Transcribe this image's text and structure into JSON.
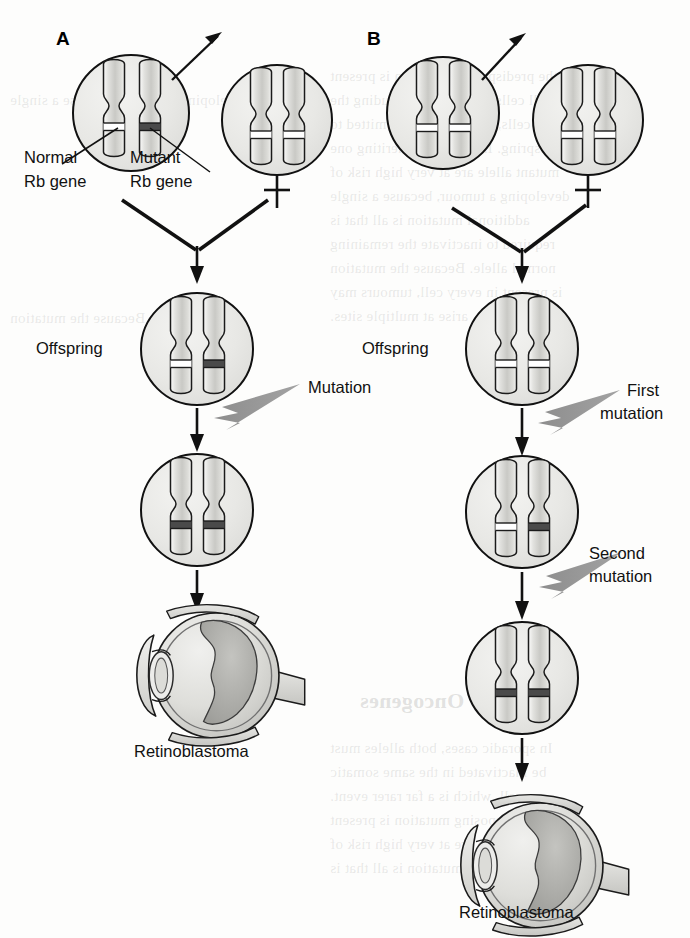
{
  "figure": {
    "background_color": "#fdfdfc",
    "ink_color": "#111111",
    "mutation_arrow_color": "#8c8c8c",
    "cell_fill": "#e9e9e7",
    "chromosome_fill_light": "#d9d9d7",
    "normal_band_color": "#ffffff",
    "mutant_band_color": "#4a4a4a",
    "width": 690,
    "height": 938
  },
  "panels": [
    {
      "letter": "A",
      "type": "hereditary",
      "parents": [
        {
          "name": "carrier-parent",
          "chromosomes": [
            {
              "band": "normal"
            },
            {
              "band": "mutant"
            }
          ],
          "callout_arrow": true
        },
        {
          "name": "normal-parent",
          "chromosomes": [
            {
              "band": "normal"
            },
            {
              "band": "normal"
            }
          ],
          "cross_symbol": "✝"
        }
      ],
      "gene_labels": [
        {
          "line1": "Normal",
          "line2": "Rb gene",
          "points_to": "left-chromosome-band"
        },
        {
          "line1": "Mutant",
          "line2": "Rb gene",
          "points_to": "right-chromosome-band"
        }
      ],
      "offspring_label": "Offspring",
      "offspring_chromosomes": [
        {
          "band": "normal"
        },
        {
          "band": "mutant"
        }
      ],
      "mutation_steps": [
        {
          "label_line1": "Mutation",
          "label_line2": "",
          "result_chromosomes": [
            {
              "band": "mutant"
            },
            {
              "band": "mutant"
            }
          ]
        }
      ],
      "outcome_label": "Retinoblastoma"
    },
    {
      "letter": "B",
      "type": "sporadic",
      "parents": [
        {
          "name": "normal-parent-left",
          "chromosomes": [
            {
              "band": "normal"
            },
            {
              "band": "normal"
            }
          ],
          "callout_arrow": true
        },
        {
          "name": "normal-parent-right",
          "chromosomes": [
            {
              "band": "normal"
            },
            {
              "band": "normal"
            }
          ],
          "cross_symbol": "✝"
        }
      ],
      "gene_labels": [],
      "offspring_label": "Offspring",
      "offspring_chromosomes": [
        {
          "band": "normal"
        },
        {
          "band": "normal"
        }
      ],
      "mutation_steps": [
        {
          "label_line1": "First",
          "label_line2": "mutation",
          "result_chromosomes": [
            {
              "band": "normal"
            },
            {
              "band": "mutant"
            }
          ]
        },
        {
          "label_line1": "Second",
          "label_line2": "mutation",
          "result_chromosomes": [
            {
              "band": "mutant"
            },
            {
              "band": "mutant"
            }
          ]
        }
      ],
      "outcome_label": "Retinoblastoma"
    }
  ],
  "ghost_text": {
    "lines": [
      "the predisposing mutation is present",
      "in all cells of the body, including the",
      "germ cells, and may be transmitted to",
      "offspring. Individuals inheriting one",
      "mutant allele are at very high risk of",
      "developing a tumour, because a single",
      "additional mutation is all that is",
      "required to inactivate the remaining",
      "normal allele. Because the mutation",
      "is present in every cell, tumours may",
      "arise at multiple sites.",
      "In sporadic cases, both alleles must",
      "be inactivated in the same somatic",
      "cell, which is a far rarer event."
    ],
    "heading": "Oncogenes"
  }
}
